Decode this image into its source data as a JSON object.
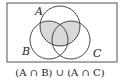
{
  "diagram": {
    "type": "venn",
    "sets": [
      {
        "label": "A",
        "cx": 60,
        "cy": 26,
        "r": 20
      },
      {
        "label": "B",
        "cx": 49,
        "cy": 40,
        "r": 19
      },
      {
        "label": "C",
        "cx": 71,
        "cy": 40,
        "r": 19
      }
    ],
    "shaded_region": "(A ∩ B) ∪ (A ∩ C)",
    "caption": "(A ∩ B) ∪ (A ∩ C)",
    "colors": {
      "shade": "#d9d9d9",
      "stroke": "#333333"
    }
  }
}
